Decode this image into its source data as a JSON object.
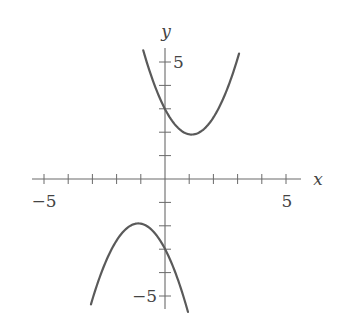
{
  "chart_data": {
    "type": "line",
    "title": "",
    "xlabel": "x",
    "ylabel": "y",
    "xlim": [
      -5.5,
      5.5
    ],
    "ylim": [
      -5.6,
      5.8
    ],
    "grid": false,
    "legend": null,
    "x_tick_values": [
      -5,
      -4,
      -3,
      -2,
      -1,
      1,
      2,
      3,
      4,
      5
    ],
    "y_tick_values": [
      -5,
      -4,
      -3,
      -2,
      -1,
      1,
      2,
      3,
      4,
      5
    ],
    "x_tick_labels": [
      {
        "value": -5,
        "label": "−5"
      },
      {
        "value": 5,
        "label": "5"
      }
    ],
    "y_tick_labels": [
      {
        "value": 5,
        "label": "5"
      },
      {
        "value": -5,
        "label": "−5"
      }
    ],
    "series": [
      {
        "name": "upper parabola",
        "description": "opens upward, vertex approx (1.1, 1.9), y-intercept approx 3",
        "a": 0.9,
        "h": 1.1,
        "k": 1.9,
        "x_range": [
          -0.9,
          3.06
        ],
        "points": [
          [
            -0.9,
            5.5
          ],
          [
            0,
            3.0
          ],
          [
            1.1,
            1.9
          ],
          [
            2,
            2.63
          ],
          [
            3.06,
            5.36
          ]
        ]
      },
      {
        "name": "lower parabola",
        "description": "opens downward, vertex approx (-1.1, -1.9), y-intercept approx -3",
        "a": -0.9,
        "h": -1.1,
        "k": -1.9,
        "x_range": [
          -3.06,
          0.95
        ],
        "points": [
          [
            -3.06,
            -5.36
          ],
          [
            -2,
            -2.63
          ],
          [
            -1.1,
            -1.9
          ],
          [
            0,
            -3.0
          ],
          [
            0.95,
            -5.68
          ]
        ]
      }
    ],
    "colors": {
      "curve": "#5a5a5a",
      "axis": "#6a6a6a",
      "text": "#444444"
    }
  }
}
